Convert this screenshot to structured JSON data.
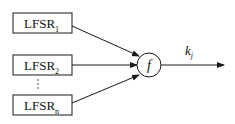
{
  "diagram": {
    "registers": [
      {
        "label": "LFSR",
        "sub": "1"
      },
      {
        "label": "LFSR",
        "sub": "2"
      },
      {
        "label": "LFSR",
        "sub": "n"
      }
    ],
    "ellipsis": "⋮",
    "combiner": {
      "label": "f"
    },
    "output": {
      "label": "k",
      "sub": "j"
    },
    "colors": {
      "stroke": "#1a1a1a",
      "background": "#ffffff"
    }
  }
}
